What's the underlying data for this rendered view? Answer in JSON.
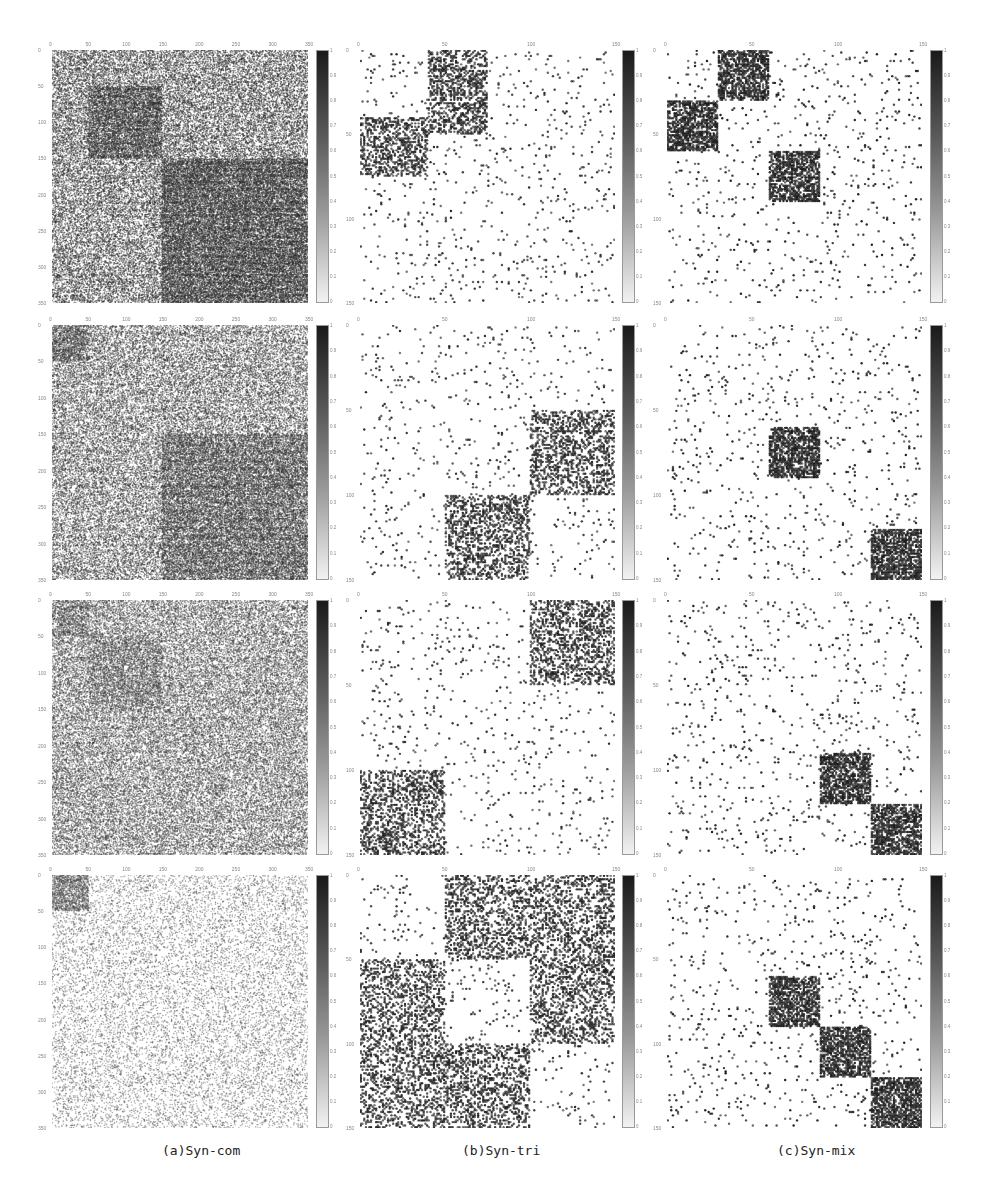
{
  "figure": {
    "captions": [
      "(a)Syn-com",
      "(b)Syn-tri",
      "(c)Syn-mix"
    ],
    "colorbar_ticks": [
      "0",
      "0.1",
      "0.2",
      "0.3",
      "0.4",
      "0.5",
      "0.6",
      "0.7",
      "0.8",
      "0.9",
      "1"
    ],
    "colors": {
      "marker": "#222222",
      "background": "#ffffff",
      "axis_text": "#888888"
    }
  },
  "chart_data": [
    {
      "type": "heatmap",
      "panel": "a-row1",
      "title": "",
      "range": 350,
      "ticks": [
        0,
        50,
        100,
        150,
        200,
        250,
        300,
        350
      ],
      "background_density": 0.3,
      "marker_alpha": 0.55,
      "blocks": [
        {
          "r0": 50,
          "r1": 150,
          "c0": 50,
          "c1": 150,
          "density": 0.55
        },
        {
          "r0": 150,
          "r1": 350,
          "c0": 150,
          "c1": 350,
          "density": 0.58
        }
      ],
      "colorbar": [
        0,
        1
      ]
    },
    {
      "type": "heatmap",
      "panel": "b-row1",
      "range": 150,
      "ticks": [
        0,
        50,
        100,
        150
      ],
      "background_density": 0.03,
      "marker_alpha": 0.9,
      "blocks": [
        {
          "r0": 0,
          "r1": 50,
          "c0": 40,
          "c1": 75,
          "density": 0.45
        },
        {
          "r0": 40,
          "r1": 75,
          "c0": 0,
          "c1": 40,
          "density": 0.45
        }
      ],
      "colorbar": [
        0,
        1
      ]
    },
    {
      "type": "heatmap",
      "panel": "c-row1",
      "range": 150,
      "ticks": [
        0,
        50,
        100,
        150
      ],
      "background_density": 0.03,
      "marker_alpha": 0.95,
      "blocks": [
        {
          "r0": 0,
          "r1": 30,
          "c0": 30,
          "c1": 60,
          "density": 0.7
        },
        {
          "r0": 30,
          "r1": 60,
          "c0": 0,
          "c1": 30,
          "density": 0.7
        },
        {
          "r0": 60,
          "r1": 90,
          "c0": 60,
          "c1": 90,
          "density": 0.7
        }
      ],
      "colorbar": [
        0,
        1
      ]
    },
    {
      "type": "heatmap",
      "panel": "a-row2",
      "range": 350,
      "ticks": [
        0,
        50,
        100,
        150,
        200,
        250,
        300,
        350
      ],
      "background_density": 0.28,
      "marker_alpha": 0.5,
      "blocks": [
        {
          "r0": 0,
          "r1": 50,
          "c0": 0,
          "c1": 50,
          "density": 0.5
        },
        {
          "r0": 150,
          "r1": 350,
          "c0": 150,
          "c1": 350,
          "density": 0.5
        }
      ],
      "colorbar": [
        0,
        1
      ]
    },
    {
      "type": "heatmap",
      "panel": "b-row2",
      "range": 150,
      "ticks": [
        0,
        50,
        100,
        150
      ],
      "background_density": 0.03,
      "marker_alpha": 0.9,
      "blocks": [
        {
          "r0": 50,
          "r1": 100,
          "c0": 100,
          "c1": 150,
          "density": 0.4
        },
        {
          "r0": 100,
          "r1": 150,
          "c0": 50,
          "c1": 100,
          "density": 0.4
        }
      ],
      "colorbar": [
        0,
        1
      ]
    },
    {
      "type": "heatmap",
      "panel": "c-row2",
      "range": 150,
      "ticks": [
        0,
        50,
        100,
        150
      ],
      "background_density": 0.03,
      "marker_alpha": 0.95,
      "blocks": [
        {
          "r0": 60,
          "r1": 90,
          "c0": 60,
          "c1": 90,
          "density": 0.7
        },
        {
          "r0": 120,
          "r1": 150,
          "c0": 120,
          "c1": 150,
          "density": 0.7
        }
      ],
      "colorbar": [
        0,
        1
      ]
    },
    {
      "type": "heatmap",
      "panel": "a-row3",
      "range": 350,
      "ticks": [
        0,
        50,
        100,
        150,
        200,
        250,
        300,
        350
      ],
      "background_density": 0.3,
      "marker_alpha": 0.45,
      "blocks": [
        {
          "r0": 0,
          "r1": 50,
          "c0": 0,
          "c1": 50,
          "density": 0.45
        },
        {
          "r0": 50,
          "r1": 150,
          "c0": 50,
          "c1": 150,
          "density": 0.42
        }
      ],
      "colorbar": [
        0,
        1
      ]
    },
    {
      "type": "heatmap",
      "panel": "b-row3",
      "range": 150,
      "ticks": [
        0,
        50,
        100,
        150
      ],
      "background_density": 0.03,
      "marker_alpha": 0.9,
      "blocks": [
        {
          "r0": 0,
          "r1": 50,
          "c0": 100,
          "c1": 150,
          "density": 0.4
        },
        {
          "r0": 100,
          "r1": 150,
          "c0": 0,
          "c1": 50,
          "density": 0.4
        }
      ],
      "colorbar": [
        0,
        1
      ]
    },
    {
      "type": "heatmap",
      "panel": "c-row3",
      "range": 150,
      "ticks": [
        0,
        50,
        100,
        150
      ],
      "background_density": 0.03,
      "marker_alpha": 0.95,
      "blocks": [
        {
          "r0": 90,
          "r1": 120,
          "c0": 90,
          "c1": 120,
          "density": 0.7
        },
        {
          "r0": 120,
          "r1": 150,
          "c0": 120,
          "c1": 150,
          "density": 0.7
        }
      ],
      "colorbar": [
        0,
        1
      ]
    },
    {
      "type": "heatmap",
      "panel": "a-row4",
      "range": 350,
      "ticks": [
        0,
        50,
        100,
        150,
        200,
        250,
        300,
        350
      ],
      "background_density": 0.1,
      "marker_alpha": 0.4,
      "blocks": [
        {
          "r0": 0,
          "r1": 50,
          "c0": 0,
          "c1": 50,
          "density": 0.5
        }
      ],
      "colorbar": [
        0,
        1
      ]
    },
    {
      "type": "heatmap",
      "panel": "b-row4",
      "range": 150,
      "ticks": [
        0,
        50,
        100,
        150
      ],
      "background_density": 0.03,
      "marker_alpha": 0.9,
      "blocks": [
        {
          "r0": 0,
          "r1": 50,
          "c0": 50,
          "c1": 150,
          "density": 0.35
        },
        {
          "r0": 50,
          "r1": 100,
          "c0": 0,
          "c1": 50,
          "density": 0.35
        },
        {
          "r0": 50,
          "r1": 100,
          "c0": 100,
          "c1": 150,
          "density": 0.35
        },
        {
          "r0": 100,
          "r1": 150,
          "c0": 0,
          "c1": 100,
          "density": 0.35
        }
      ],
      "colorbar": [
        0,
        1
      ]
    },
    {
      "type": "heatmap",
      "panel": "c-row4",
      "range": 150,
      "ticks": [
        0,
        50,
        100,
        150
      ],
      "background_density": 0.03,
      "marker_alpha": 0.95,
      "blocks": [
        {
          "r0": 60,
          "r1": 90,
          "c0": 60,
          "c1": 90,
          "density": 0.7
        },
        {
          "r0": 90,
          "r1": 120,
          "c0": 90,
          "c1": 120,
          "density": 0.7
        },
        {
          "r0": 120,
          "r1": 150,
          "c0": 120,
          "c1": 150,
          "density": 0.7
        }
      ],
      "colorbar": [
        0,
        1
      ]
    }
  ]
}
